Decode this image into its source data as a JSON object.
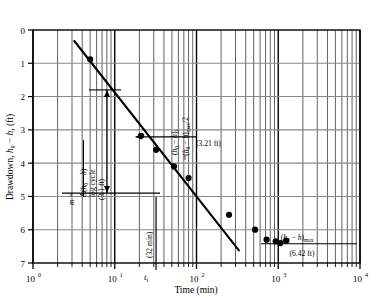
{
  "chart_data": {
    "type": "scatter",
    "title": "",
    "xlabel": "Time (min)",
    "ylabel": "Drawdown, h0 − h, (ft)",
    "xscale": "log",
    "yscale": "linear",
    "xlim": [
      1,
      10000
    ],
    "ylim": [
      7,
      0
    ],
    "grid": true,
    "legend_position": "none",
    "x_tick_labels": [
      "10",
      "10",
      "10",
      "10",
      "10"
    ],
    "x_tick_exponents": [
      "0",
      "1",
      "2",
      "3",
      "4"
    ],
    "x_tick_values": [
      1,
      10,
      100,
      1000,
      10000
    ],
    "y_tick_labels": [
      "0",
      "1",
      "2",
      "3",
      "4",
      "5",
      "6",
      "7"
    ],
    "y_tick_values": [
      0,
      1,
      2,
      3,
      4,
      5,
      6,
      7
    ],
    "series": [
      {
        "name": "drawdown data",
        "marker": "filled-circle",
        "points": [
          {
            "x": 5.0,
            "y": 0.88
          },
          {
            "x": 21.0,
            "y": 3.18
          },
          {
            "x": 32.0,
            "y": 3.6
          },
          {
            "x": 53.0,
            "y": 4.1
          },
          {
            "x": 80.0,
            "y": 4.45
          },
          {
            "x": 250.0,
            "y": 5.55
          },
          {
            "x": 520.0,
            "y": 6.0
          },
          {
            "x": 720.0,
            "y": 6.3
          },
          {
            "x": 930.0,
            "y": 6.35
          },
          {
            "x": 1060.0,
            "y": 6.4
          },
          {
            "x": 1250.0,
            "y": 6.33
          }
        ]
      }
    ],
    "fit_line": {
      "name": "semilog straight-line fit",
      "x_start": 3.2,
      "y_start": 0.33,
      "x_end": 330.0,
      "y_end": 6.62
    },
    "annotations": [
      {
        "name": "slope-annotation",
        "text_numerator": "Δ(h0 − h)",
        "text_denominator": "log cycle",
        "text_lhs": "m =",
        "orientation": "vertical"
      },
      {
        "name": "delta-value-label",
        "text": "(3.1 ft)",
        "orientation": "vertical"
      },
      {
        "name": "half-max-annotation",
        "text_a": "(h0 − h)i",
        "text_b": "= (h0 − h)max/2",
        "orientation": "vertical"
      },
      {
        "name": "half-max-value-label",
        "text": "(3.21 ft)",
        "orientation": "horizontal"
      },
      {
        "name": "ti-value-label",
        "text": "(32 min)",
        "orientation": "vertical"
      },
      {
        "name": "ti-axis-label",
        "text": "ti",
        "orientation": "horizontal"
      },
      {
        "name": "max-drawdown-annotation",
        "text_top": "(h0 − h)max",
        "text_bottom": "(6.42 ft)",
        "orientation": "horizontal"
      }
    ],
    "markers": {
      "ti_x": 32.0,
      "half_max_y": 3.21,
      "max_drawdown_y": 6.42,
      "delta_per_log_cycle": 3.1,
      "delta_arrow_y_top": 1.8,
      "delta_arrow_y_bottom": 4.9
    }
  }
}
